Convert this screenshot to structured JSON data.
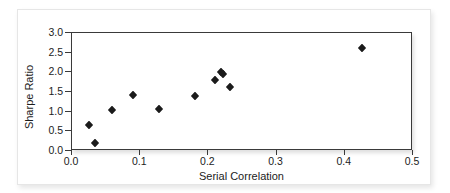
{
  "chart_data": {
    "type": "scatter",
    "title": "",
    "xlabel": "Serial Correlation",
    "ylabel": "Sharpe Ratio",
    "xlim": [
      0.0,
      0.5
    ],
    "ylim": [
      0.0,
      3.0
    ],
    "xticks": [
      "0.0",
      "0.1",
      "0.2",
      "0.3",
      "0.4",
      "0.5"
    ],
    "xtick_values": [
      0.0,
      0.1,
      0.2,
      0.3,
      0.4,
      0.5
    ],
    "yticks": [
      "0.0",
      "0.5",
      "1.0",
      "1.5",
      "2.0",
      "2.5",
      "3.0"
    ],
    "ytick_values": [
      0.0,
      0.5,
      1.0,
      1.5,
      2.0,
      2.5,
      3.0
    ],
    "grid": false,
    "legend": false,
    "marker": "diamond",
    "marker_color": "#1b1b1b",
    "points": [
      {
        "x": 0.025,
        "y": 0.67
      },
      {
        "x": 0.033,
        "y": 0.21
      },
      {
        "x": 0.058,
        "y": 1.05
      },
      {
        "x": 0.09,
        "y": 1.42
      },
      {
        "x": 0.128,
        "y": 1.07
      },
      {
        "x": 0.18,
        "y": 1.4
      },
      {
        "x": 0.21,
        "y": 1.81
      },
      {
        "x": 0.219,
        "y": 2.02
      },
      {
        "x": 0.222,
        "y": 1.97
      },
      {
        "x": 0.231,
        "y": 1.62
      },
      {
        "x": 0.425,
        "y": 2.62
      }
    ]
  }
}
